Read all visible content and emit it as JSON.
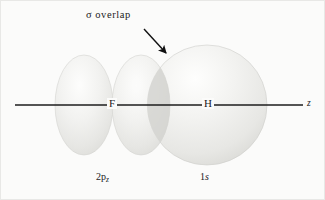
{
  "figure": {
    "background_color": "#fbfbfa",
    "line_color": "#1a1a1a",
    "orbital_fill_light": "#f0f0ee",
    "orbital_fill_mid": "#e2e2df",
    "orbital_overlap_color": "#d2d2cf"
  },
  "annotations": {
    "sigma_symbol": "σ",
    "sigma_overlap_label": "overlap",
    "arrow_name": "overlap-pointer-arrow"
  },
  "atoms": [
    {
      "symbol": "F",
      "name": "fluorine",
      "x": 112
    },
    {
      "symbol": "H",
      "name": "hydrogen",
      "x": 207
    }
  ],
  "orbitals": [
    {
      "name": "2p-z-orbital",
      "base": "2p",
      "subscript": "z",
      "atom": "F",
      "shape": "two-lobe",
      "lobes": [
        {
          "cx": 84,
          "cy": 105,
          "rx": 29,
          "ry": 50
        },
        {
          "cx": 141,
          "cy": 105,
          "rx": 29,
          "ry": 50
        }
      ]
    },
    {
      "name": "1s-orbital",
      "base": "1",
      "subscript": "s",
      "atom": "H",
      "shape": "sphere",
      "sphere": {
        "cx": 207,
        "cy": 105,
        "r": 60
      }
    }
  ],
  "axis": {
    "name": "z-axis",
    "label": "z",
    "x_start": 15,
    "x_end": 303,
    "y": 105
  },
  "overlap_region": {
    "name": "sigma-overlap-region",
    "x_min": 147,
    "x_max": 170,
    "description": "lens-shaped intersection of the 2p_z lobe and the 1s sphere"
  }
}
